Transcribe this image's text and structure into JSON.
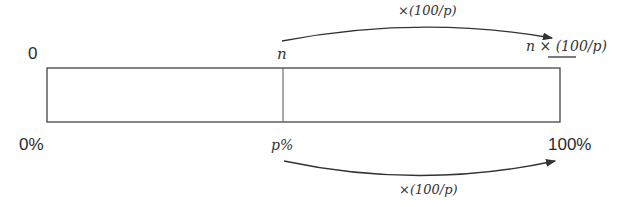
{
  "diagram": {
    "top_labels": {
      "start": "0",
      "mid": "n",
      "end": "n × (100/p)"
    },
    "bottom_labels": {
      "start": "0%",
      "mid": "p%",
      "end": "100%"
    },
    "arrows": {
      "top": "×(100/p)",
      "bottom": "×(100/p)"
    },
    "colors": {
      "line": "#333333",
      "background": "#ffffff"
    }
  }
}
